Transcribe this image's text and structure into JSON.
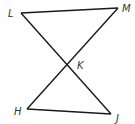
{
  "diagram": {
    "type": "geometry",
    "stroke_color": "#1a1a1a",
    "points": {
      "L": {
        "label": "L",
        "x": 21,
        "y": 13
      },
      "M": {
        "label": "M",
        "x": 118,
        "y": 8
      },
      "K": {
        "label": "K",
        "x": 68,
        "y": 65
      },
      "H": {
        "label": "H",
        "x": 27,
        "y": 109
      },
      "J": {
        "label": "J",
        "x": 111,
        "y": 114
      }
    },
    "segments": [
      "LM",
      "LJ",
      "MH",
      "HJ"
    ]
  }
}
